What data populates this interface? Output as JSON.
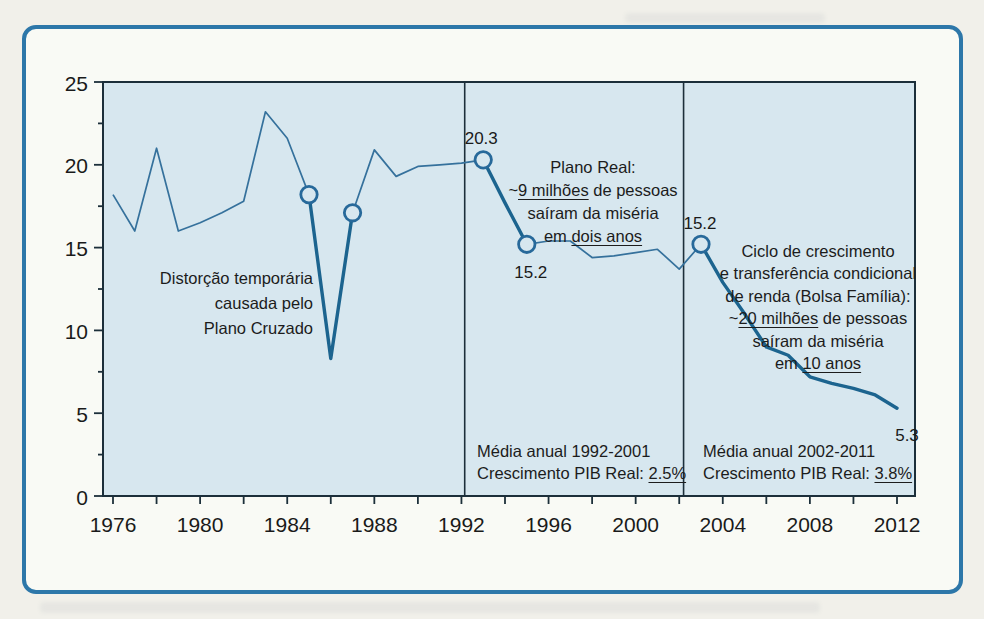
{
  "figure": {
    "kind": "scanned-book-figure",
    "colors": {
      "page_bg": "#f1f0ea",
      "card_bg": "#f9faf5",
      "card_border": "#2d77a9",
      "plot_bg": "#d7e7ef",
      "frame": "#1c2f3a",
      "line": "#35719c",
      "highlight_line": "#1c648f",
      "ring": "#27699a",
      "text": "#1a1a1a"
    }
  },
  "chart_data": {
    "type": "line",
    "title": "",
    "xlabel": "",
    "ylabel": "",
    "xlim": [
      1975.5,
      2012.8
    ],
    "ylim": [
      0,
      25
    ],
    "grid": false,
    "legend": "none",
    "x_major_ticks": [
      1976,
      1980,
      1984,
      1988,
      1992,
      1996,
      2000,
      2004,
      2008,
      2012
    ],
    "x_minor_step": 2,
    "y_major_ticks": [
      0,
      5,
      10,
      15,
      20,
      25
    ],
    "y_minor_step": 2.5,
    "dividers_years": [
      1992.15,
      2002.2
    ],
    "series": [
      {
        "name": "percentual-na-miseria",
        "points": [
          [
            1976,
            18.2
          ],
          [
            1977,
            16.0
          ],
          [
            1978,
            21.0
          ],
          [
            1979,
            16.0
          ],
          [
            1980,
            16.5
          ],
          [
            1981,
            17.1
          ],
          [
            1982,
            17.8
          ],
          [
            1983,
            23.2
          ],
          [
            1984,
            21.6
          ],
          [
            1985,
            18.2
          ],
          [
            1986,
            8.3
          ],
          [
            1987,
            17.1
          ],
          [
            1988,
            20.9
          ],
          [
            1989,
            19.3
          ],
          [
            1990,
            19.9
          ],
          [
            1991,
            20.0
          ],
          [
            1992,
            20.1
          ],
          [
            1993,
            20.3
          ],
          [
            1994,
            17.7
          ],
          [
            1995,
            15.2
          ],
          [
            1996,
            15.4
          ],
          [
            1997,
            15.4
          ],
          [
            1998,
            14.4
          ],
          [
            1999,
            14.5
          ],
          [
            2000,
            14.7
          ],
          [
            2001,
            14.9
          ],
          [
            2002,
            13.7
          ],
          [
            2003,
            15.2
          ],
          [
            2004,
            12.9
          ],
          [
            2005,
            11.0
          ],
          [
            2006,
            9.0
          ],
          [
            2007,
            8.5
          ],
          [
            2008,
            7.2
          ],
          [
            2009,
            6.8
          ],
          [
            2010,
            6.5
          ],
          [
            2011,
            6.1
          ],
          [
            2012,
            5.3
          ]
        ]
      }
    ],
    "highlight_segments": [
      [
        1985,
        1987
      ],
      [
        1993,
        1995
      ],
      [
        2003,
        2012
      ]
    ],
    "marked_points": [
      {
        "year": 1985,
        "value": 18.2
      },
      {
        "year": 1987,
        "value": 17.1
      },
      {
        "year": 1993,
        "value": 20.3
      },
      {
        "year": 1995,
        "value": 15.2
      },
      {
        "year": 2003,
        "value": 15.2
      }
    ],
    "point_labels": [
      {
        "text": "20.3",
        "year": 1993,
        "value": 20.3,
        "dx": -2,
        "dy": -21
      },
      {
        "text": "15.2",
        "year": 1995,
        "value": 15.2,
        "dx": 4,
        "dy": 28
      },
      {
        "text": "15.2",
        "year": 2003,
        "value": 15.2,
        "dx": -1,
        "dy": -21
      },
      {
        "text": "5.3",
        "year": 2012,
        "value": 5.3,
        "dx": 10,
        "dy": 27
      }
    ]
  },
  "annotations": [
    {
      "id": "plano-cruzado",
      "align": "right",
      "x": 313,
      "y": 266,
      "lh": 25,
      "fs": 16.5,
      "lines": [
        [
          {
            "t": "Distorção temporária"
          }
        ],
        [
          {
            "t": "causada pelo"
          }
        ],
        [
          {
            "t": "Plano Cruzado"
          }
        ]
      ]
    },
    {
      "id": "plano-real",
      "align": "center",
      "x": 593,
      "y": 156,
      "lh": 23,
      "fs": 16.5,
      "lines": [
        [
          {
            "t": "Plano Real:"
          }
        ],
        [
          {
            "t": "~"
          },
          {
            "t": "9 milhões",
            "u": 1
          },
          {
            "t": " de pessoas"
          }
        ],
        [
          {
            "t": "saíram da miséria"
          }
        ],
        [
          {
            "t": "em "
          },
          {
            "t": "dois anos",
            "u": 1
          }
        ]
      ]
    },
    {
      "id": "bolsa-familia",
      "align": "center",
      "x": 818,
      "y": 240,
      "lh": 22.4,
      "fs": 16.5,
      "lines": [
        [
          {
            "t": "Ciclo de crescimento"
          }
        ],
        [
          {
            "t": "e transferência condicional"
          }
        ],
        [
          {
            "t": "de renda (Bolsa Família):"
          }
        ],
        [
          {
            "t": "~"
          },
          {
            "t": "20 milhões",
            "u": 1
          },
          {
            "t": " de pessoas"
          }
        ],
        [
          {
            "t": "saíram da miséria"
          }
        ],
        [
          {
            "t": "em "
          },
          {
            "t": "10 anos",
            "u": 1
          }
        ]
      ]
    },
    {
      "id": "media-1992-2001",
      "align": "left",
      "x": 477,
      "y": 440,
      "lh": 22,
      "fs": 16.5,
      "lines": [
        [
          {
            "t": "Média anual 1992-2001"
          }
        ],
        [
          {
            "t": "Crescimento PIB Real: "
          },
          {
            "t": "2.5%",
            "u": 1
          }
        ]
      ]
    },
    {
      "id": "media-2002-2011",
      "align": "left",
      "x": 703,
      "y": 440,
      "lh": 22,
      "fs": 16.5,
      "lines": [
        [
          {
            "t": "Média anual 2002-2011"
          }
        ],
        [
          {
            "t": "Crescimento PIB Real: "
          },
          {
            "t": "3.8%",
            "u": 1
          }
        ]
      ]
    }
  ]
}
